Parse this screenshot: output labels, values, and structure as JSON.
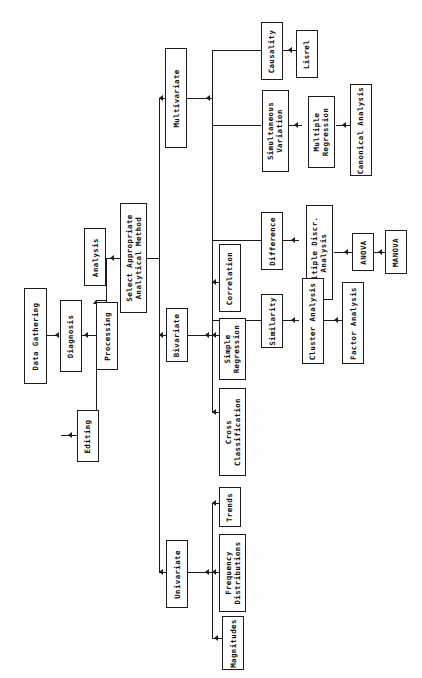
{
  "diagram": {
    "orientation": "rotated-90-ccw",
    "line_color": "#1b1b1b",
    "box_fill": "#ffffff",
    "nodes": {
      "data_gathering": "Data Gathering",
      "diagnosis": "Diagnosis",
      "editing": "Editing",
      "processing": "Processing",
      "analysis": "Analysis",
      "select_method": "Select Appropriate\nAnalytical Method",
      "multivariate": "Multivariate",
      "bivariate": "Bivariate",
      "univariate": "Univariate",
      "causality": "Causality",
      "lisrel": "Lisrel",
      "simultaneous_variation": "Simultaneous\nVariation",
      "multiple_regression": "Multiple\nRegression",
      "canonical_analysis": "Canonical Analysis",
      "difference": "Difference",
      "multiple_discr_analysis": "Multiple Discr.\nAnalysis",
      "anova": "ANOVA",
      "manova": "MANOVA",
      "similarity": "Similarity",
      "cluster_analysis": "Cluster Analysis",
      "factor_analysis": "Factor Analysis",
      "correlation": "Correlation",
      "simple_regression": "Simple\nRegression",
      "cross_classification": "Cross\nClassification",
      "trends": "Trends",
      "frequency_distributions": "Frequency\nDistributions",
      "magnitudes": "Magnitudes"
    },
    "edges": [
      "Data Gathering -> Diagnosis",
      "Diagnosis -> Editing",
      "Diagnosis -> Processing",
      "Processing -> Analysis",
      "Analysis -> Select Appropriate Analytical Method",
      "Select Appropriate Analytical Method -> Multivariate",
      "Select Appropriate Analytical Method -> Bivariate",
      "Select Appropriate Analytical Method -> Univariate",
      "Multivariate -> Causality",
      "Multivariate -> Simultaneous Variation",
      "Multivariate -> Difference",
      "Multivariate -> Similarity",
      "Causality -> Lisrel",
      "Simultaneous Variation -> Multiple Regression",
      "Multiple Regression -> Canonical Analysis",
      "Difference -> Multiple Discr. Analysis",
      "Multiple Discr. Analysis -> ANOVA",
      "ANOVA -> MANOVA",
      "Similarity -> Cluster Analysis",
      "Cluster Analysis -> Factor Analysis",
      "Bivariate -> Correlation",
      "Bivariate -> Simple Regression",
      "Bivariate -> Cross Classification",
      "Univariate -> Trends",
      "Univariate -> Frequency Distributions",
      "Univariate -> Magnitudes"
    ]
  }
}
